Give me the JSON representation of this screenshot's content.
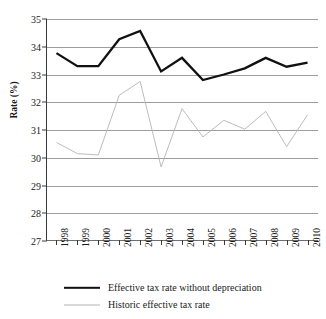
{
  "chart_data": {
    "type": "line",
    "title": "",
    "xlabel": "",
    "ylabel": "Rate (%)",
    "ylim": [
      27,
      35
    ],
    "yticks": [
      27,
      28,
      29,
      30,
      31,
      32,
      33,
      34,
      35
    ],
    "grid": true,
    "legend_position": "bottom",
    "categories": [
      "1998",
      "1999",
      "2000",
      "2001",
      "2002",
      "2003",
      "2004",
      "2005",
      "2006",
      "2007",
      "2008",
      "2009",
      "2010"
    ],
    "series": [
      {
        "name": "Effective tax rate without depreciation",
        "color": "#111111",
        "style": "solid-thick",
        "values": [
          33.77,
          33.3,
          33.3,
          34.27,
          34.57,
          33.11,
          33.6,
          32.8,
          33.0,
          33.22,
          33.6,
          33.28,
          33.43
        ]
      },
      {
        "name": "Historic effective tax rate",
        "color": "#b4b4b4",
        "style": "solid-thin",
        "values": [
          30.55,
          30.15,
          30.1,
          32.25,
          32.75,
          29.67,
          31.77,
          30.75,
          31.35,
          31.03,
          31.67,
          30.4,
          31.55
        ]
      }
    ]
  },
  "legend": {
    "items": [
      {
        "label": "Effective tax rate without depreciation"
      },
      {
        "label": "Historic effective tax rate"
      }
    ]
  }
}
